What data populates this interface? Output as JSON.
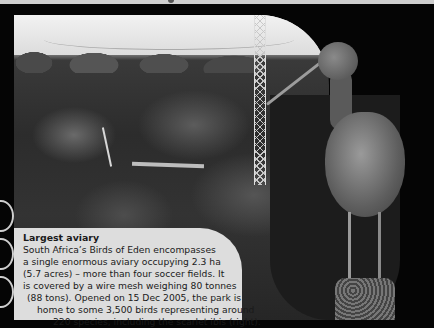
{
  "page": {
    "top_strip_glyph": "partial-header-glyph"
  },
  "photo": {
    "subject": "Birds of Eden aviary canopy with suspension walkway",
    "bird": "scarlet ibis"
  },
  "caption": {
    "title": "Largest aviary",
    "lines": [
      "South Africa’s Birds of Eden encompasses",
      "a single enormous aviary occupying 2.3 ha",
      "(5.7 acres) – more than four soccer fields. It",
      "is covered by a wire mesh weighing 80 tonnes",
      "(88 tons). Opened on 15 Dec 2005, the park is",
      "home to some 3,500 birds representing around",
      "220 species, including the scarlet ibis (right)."
    ],
    "line_indents": [
      0,
      0,
      0,
      0,
      4,
      14,
      30
    ]
  },
  "colors": {
    "background": "#050505",
    "textbox": "#dddddd",
    "text": "#1a1a1a"
  }
}
